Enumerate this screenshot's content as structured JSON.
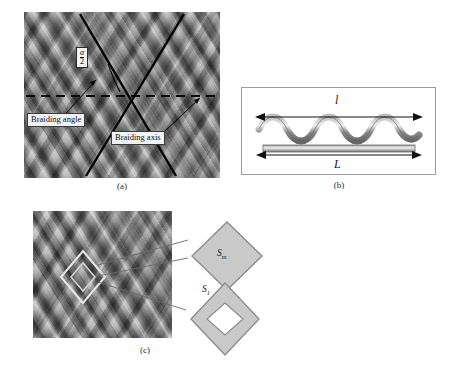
{
  "figure": {
    "background_color": "#ffffff"
  },
  "panel_a": {
    "caption": "(a)",
    "image_name": "braided-sleeve-micrograph",
    "annotations": {
      "angle_numerator": "α",
      "angle_denominator": "2",
      "braiding_angle_label": "Braiding angle",
      "braiding_axis_label": "Braiding axis"
    },
    "colors": {
      "line": "#000000",
      "callout_fill": "#f2f2f2",
      "callout_border": "#3a3a3a"
    }
  },
  "panel_b": {
    "caption": "(b)",
    "wavy_fiber_label": "l",
    "straight_fiber_label": "L",
    "colors": {
      "box_border": "#9b9b9b",
      "fiber": "#7d7d7d",
      "fiber_highlight": "#d8d8d8",
      "arrow": "#111111"
    }
  },
  "panel_c": {
    "caption": "(c)",
    "image_name": "braided-sleeve-micrograph",
    "diamonds": [
      {
        "name": "unit-cell-solid",
        "label_base": "S",
        "label_sub": "m"
      },
      {
        "name": "unit-cell-hollow",
        "label_base": "S",
        "label_sub": "1"
      }
    ],
    "colors": {
      "diamond_fill": "#c9c9c9",
      "diamond_stroke": "#7a7a7a",
      "leader_line": "#5a5a5a"
    }
  }
}
